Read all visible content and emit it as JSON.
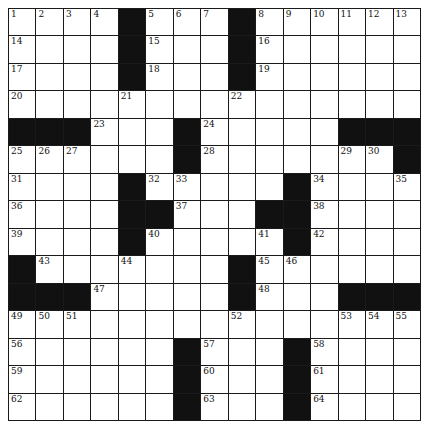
{
  "puzzle": {
    "rows": 15,
    "cols": 15,
    "layout": [
      "....#...#......",
      "....#...#......",
      "....#...#......",
      "...............",
      "###...#....####"
    ],
    "grid": [
      [
        "1",
        "2",
        "3",
        "4",
        "#",
        "5",
        "6",
        "7",
        "#",
        "8",
        "9",
        "10",
        "11",
        "12",
        "13"
      ],
      [
        "14",
        "",
        "",
        "",
        "#",
        "15",
        "",
        "",
        "#",
        "16",
        "",
        "",
        "",
        "",
        ""
      ],
      [
        "17",
        "",
        "",
        "",
        "#",
        "18",
        "",
        "",
        "#",
        "19",
        "",
        "",
        "",
        "",
        ""
      ],
      [
        "20",
        "",
        "",
        "",
        "21",
        "",
        "",
        "",
        "22",
        "",
        "",
        "",
        "",
        "",
        ""
      ],
      [
        "#",
        "#",
        "#",
        "23",
        "",
        "",
        "#",
        "24",
        "",
        "",
        "",
        "",
        "#",
        "#",
        "#"
      ],
      [
        "25",
        "26",
        "27",
        "",
        "",
        "",
        "#",
        "28",
        "",
        "",
        "",
        "",
        "29",
        "30",
        "#"
      ],
      [
        "31",
        "",
        "",
        "",
        "#",
        "32",
        "33",
        "",
        "",
        "",
        "#",
        "34",
        "",
        "",
        "35"
      ],
      [
        "36",
        "",
        "",
        "",
        "#",
        "#",
        "37",
        "",
        "",
        "#",
        "#",
        "38",
        "",
        "",
        ""
      ],
      [
        "39",
        "",
        "",
        "",
        "#",
        "40",
        "",
        "",
        "",
        "41",
        "#",
        "42",
        "",
        "",
        ""
      ],
      [
        "#",
        "43",
        "",
        "",
        "44",
        "",
        "",
        "",
        "#",
        "45",
        "46",
        "",
        "",
        "",
        ""
      ],
      [
        "#",
        "#",
        "#",
        "47",
        "",
        "",
        "",
        "",
        "#",
        "48",
        "",
        "",
        "#",
        "#",
        "#"
      ],
      [
        "49",
        "50",
        "51",
        "",
        "",
        "",
        "",
        "",
        "52",
        "",
        "",
        "",
        "53",
        "54",
        "55"
      ],
      [
        "56",
        "",
        "",
        "",
        "",
        "",
        "#",
        "57",
        "",
        "",
        "#",
        "58",
        "",
        "",
        ""
      ],
      [
        "59",
        "",
        "",
        "",
        "",
        "",
        "#",
        "60",
        "",
        "",
        "#",
        "61",
        "",
        "",
        ""
      ],
      [
        "62",
        "",
        "",
        "",
        "",
        "",
        "#",
        "63",
        "",
        "",
        "#",
        "64",
        "",
        "",
        ""
      ]
    ]
  }
}
